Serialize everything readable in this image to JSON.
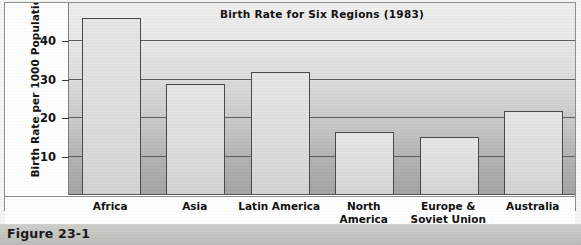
{
  "figure": {
    "caption": "Figure 23-1"
  },
  "chart_data": {
    "type": "bar",
    "title": "Birth Rate for Six Regions (1983)",
    "xlabel": "",
    "ylabel": "Birth Rate per 1000 Population",
    "categories": [
      "Africa",
      "Asia",
      "Latin America",
      "North America",
      "Europe & Soviet Union",
      "Australia"
    ],
    "values": [
      46,
      29,
      32,
      16.5,
      15,
      22
    ],
    "ylim": [
      0,
      50
    ],
    "yticks": [
      10,
      20,
      30,
      40
    ],
    "ytick_labels": [
      "10",
      "20",
      "30",
      "40"
    ],
    "grid": true,
    "legend": "none",
    "accent_color": "#dcdcdc",
    "bar_edge_color": "#4a4a4a",
    "gridline_color": "#5f5f5f"
  }
}
